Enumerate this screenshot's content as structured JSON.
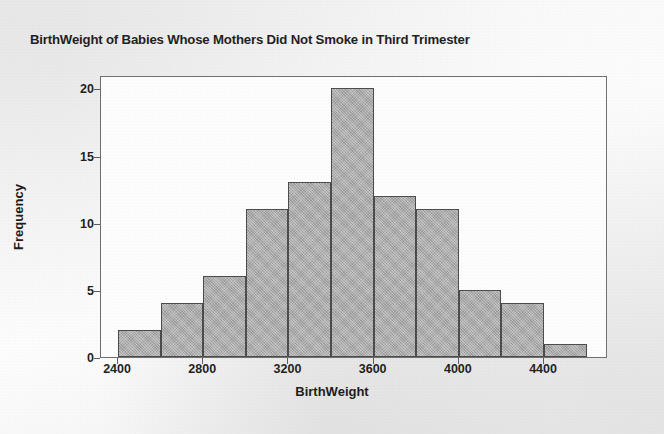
{
  "chart_data": {
    "type": "bar",
    "title": "BirthWeight of Babies Whose Mothers Did Not Smoke in Third Trimester",
    "xlabel": "BirthWeight",
    "ylabel": "Frequency",
    "bin_width": 200,
    "bin_starts": [
      2400,
      2600,
      2800,
      3000,
      3200,
      3400,
      3600,
      3800,
      4000,
      4200,
      4400
    ],
    "categories": [
      "2400-2600",
      "2600-2800",
      "2800-3000",
      "3000-3200",
      "3200-3400",
      "3400-3600",
      "3600-3800",
      "3800-4000",
      "4000-4200",
      "4200-4400",
      "4400-4600"
    ],
    "values": [
      2,
      4,
      6,
      11,
      13,
      20,
      12,
      11,
      5,
      4,
      1
    ],
    "xlim": [
      2320,
      4700
    ],
    "ylim": [
      0,
      21
    ],
    "x_ticks": [
      2400,
      2800,
      3200,
      3600,
      4000,
      4400
    ],
    "y_ticks": [
      0,
      5,
      10,
      15,
      20
    ],
    "grid": false,
    "legend": "none",
    "bar_fill_color": "#a9a9a9",
    "bar_border_color": "#4a4a4a",
    "plot_background": "#ffffff",
    "page_background": "#fbfbfb",
    "text_color": "#1a1a1a"
  }
}
